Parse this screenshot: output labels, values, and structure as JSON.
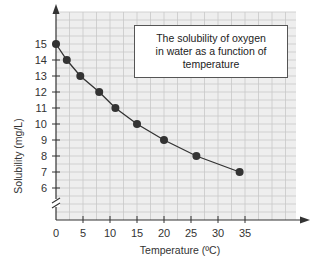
{
  "chart_data": {
    "type": "line",
    "title": "The solubility of oxygen in water as a function of temperature",
    "title_lines": [
      "The solubility of oxygen",
      "in water as a function of",
      "temperature"
    ],
    "xlabel": "Temperature (ºC)",
    "ylabel": "Solubility (mg/L)",
    "x_ticks": [
      0,
      5,
      10,
      15,
      20,
      25,
      30,
      35
    ],
    "y_ticks": [
      6,
      7,
      8,
      9,
      10,
      11,
      12,
      13,
      14,
      15
    ],
    "xlim": [
      0,
      44
    ],
    "ylim": [
      4,
      17
    ],
    "y_axis_break": true,
    "grid": true,
    "series": [
      {
        "name": "Oxygen solubility",
        "x": [
          0,
          2,
          4.5,
          8,
          11,
          15,
          20,
          26,
          34
        ],
        "y": [
          15,
          14,
          13,
          12,
          11,
          10,
          9,
          8,
          7
        ],
        "color": "#333333",
        "marker": "circle"
      }
    ]
  },
  "colors": {
    "plot_background": "#eeeeee",
    "grid": "#c8c8c8",
    "axis": "#333333",
    "marker": "#333333"
  }
}
